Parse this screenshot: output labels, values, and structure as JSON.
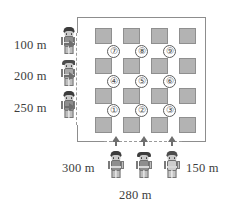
{
  "diagram": {
    "boundary": {
      "name": "field-boundary",
      "style": "rectangle"
    },
    "left_labels": [
      {
        "value": "100 m",
        "name": "distance-label-100m"
      },
      {
        "value": "200 m",
        "name": "distance-label-200m"
      },
      {
        "value": "250 m",
        "name": "distance-label-250m"
      }
    ],
    "bottom_labels": [
      {
        "value": "300 m",
        "name": "distance-label-300m"
      },
      {
        "value": "280 m",
        "name": "distance-label-280m"
      },
      {
        "value": "150 m",
        "name": "distance-label-150m"
      }
    ],
    "nodes": [
      {
        "label": "①",
        "row": 0,
        "col": 0
      },
      {
        "label": "②",
        "row": 0,
        "col": 1
      },
      {
        "label": "③",
        "row": 0,
        "col": 2
      },
      {
        "label": "④",
        "row": 1,
        "col": 0
      },
      {
        "label": "⑤",
        "row": 1,
        "col": 1
      },
      {
        "label": "⑥",
        "row": 1,
        "col": 2
      },
      {
        "label": "⑦",
        "row": 2,
        "col": 0
      },
      {
        "label": "⑧",
        "row": 2,
        "col": 1
      },
      {
        "label": "⑨",
        "row": 2,
        "col": 2
      }
    ],
    "plots": {
      "rows": 4,
      "cols": 4,
      "fill_color": "#b3b3b3",
      "border_color": "#8f8f8f"
    },
    "arrows": {
      "left_count": 3,
      "bottom_count": 3,
      "color": "#6e6e6e"
    },
    "people": {
      "left_count": 3,
      "bottom_count": 3
    },
    "colors": {
      "background": "#ffffff",
      "text": "#3d3d3d",
      "line": "#8d8d8d"
    }
  }
}
